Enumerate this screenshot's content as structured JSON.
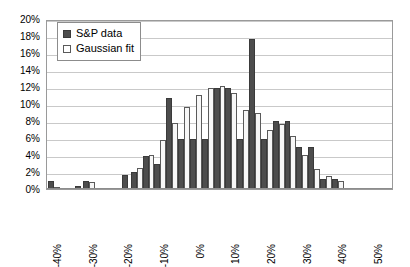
{
  "chart_data": {
    "type": "bar",
    "title": "",
    "xlabel": "",
    "ylabel": "",
    "ylim": [
      0,
      20
    ],
    "ytick_labels": [
      "20%",
      "18%",
      "16%",
      "14%",
      "12%",
      "10%",
      "8%",
      "6%",
      "4%",
      "2%",
      "0%"
    ],
    "ytick_values": [
      20,
      18,
      16,
      14,
      12,
      10,
      8,
      6,
      4,
      2,
      0
    ],
    "xtick_labels": [
      "-40%",
      "-30%",
      "-20%",
      "-10%",
      "0%",
      "10%",
      "20%",
      "30%",
      "40%",
      "50%"
    ],
    "xtick_positions": [
      0,
      3,
      6,
      9,
      12,
      15,
      18,
      21,
      24,
      27
    ],
    "grid": true,
    "legend_position": "top-left",
    "categories": [
      "-40%",
      "",
      "",
      "-30%",
      "",
      "",
      "-20%",
      "",
      "",
      "-10%",
      "",
      "",
      "0%",
      "",
      "",
      "10%",
      "",
      "",
      "20%",
      "",
      "",
      "30%",
      "",
      "",
      "40%",
      "",
      "",
      "50%",
      ""
    ],
    "series": [
      {
        "name": "S&P data",
        "color": "#4d4d4d",
        "values": [
          1.0,
          0.0,
          0.35,
          1.0,
          0.0,
          0.0,
          1.6,
          2.0,
          3.9,
          2.9,
          10.7,
          5.9,
          5.9,
          5.9,
          11.9,
          11.9,
          5.9,
          17.6,
          5.9,
          8.0,
          8.0,
          5.0,
          5.0,
          1.2,
          1.2,
          0.0,
          0.0,
          0.0,
          0.0
        ]
      },
      {
        "name": "Gaussian fit",
        "color": "#f7f7f7",
        "values": [
          0.2,
          0.0,
          0.0,
          0.85,
          0.0,
          0.0,
          0.0,
          2.5,
          4.0,
          5.8,
          7.8,
          9.7,
          11.1,
          11.9,
          12.1,
          11.3,
          9.3,
          9.0,
          6.9,
          7.6,
          6.2,
          4.0,
          2.4,
          1.5,
          1.0,
          0.0,
          0.0,
          0.0,
          0.0
        ]
      }
    ]
  },
  "legend": {
    "items": [
      {
        "label": "S&P data",
        "swatch": "filled-square"
      },
      {
        "label": "Gaussian fit",
        "swatch": "empty-square"
      }
    ]
  },
  "colors": {
    "sp_data": "#4d4d4d",
    "gaussian_fit": "#f7f7f7",
    "gridline": "#c9c9c9",
    "axis": "#9a9a9a",
    "text": "#000000"
  }
}
